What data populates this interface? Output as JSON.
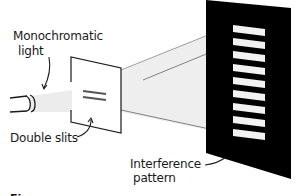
{
  "labels": {
    "light_line1": "Monochromatic",
    "light_line2": "light",
    "slits": "Double slits",
    "pattern_line1": "Interference",
    "pattern_line2": "pattern"
  },
  "caption": "Figure",
  "colors": {
    "screen": "#000000",
    "fringe": "#f2f2f2",
    "beam": "#ececec",
    "ink": "#1a1a1a",
    "background": "#ffffff"
  },
  "fringes": {
    "count": 9
  }
}
